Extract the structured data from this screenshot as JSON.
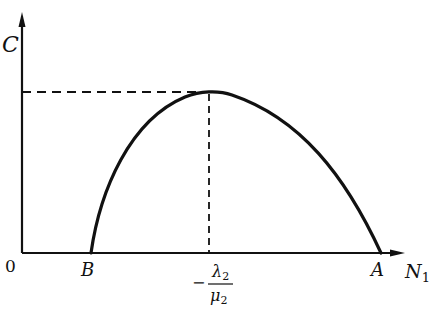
{
  "diagram": {
    "y_axis_label": "C",
    "x_axis_label_main": "N",
    "x_axis_label_sub": "1",
    "origin_label": "0",
    "point_b_label": "B",
    "point_a_label": "A",
    "peak_x_label": {
      "sign": "−",
      "numerator_main": "λ",
      "numerator_sub": "2",
      "denominator_main": "μ",
      "denominator_sub": "2"
    },
    "curve": {
      "description": "Concave-down parabola-like curve starting at B on the N1 axis, peaking above −λ2/μ2, and returning to the N1 axis at A",
      "start": "B",
      "peak_at": "−λ2/μ2",
      "end": "A"
    },
    "guides": {
      "horizontal_dashed": "from C axis to peak",
      "vertical_dashed": "from peak down to −λ2/μ2 on N1 axis"
    },
    "colors": {
      "ink": "#111111",
      "background": "#ffffff"
    }
  }
}
